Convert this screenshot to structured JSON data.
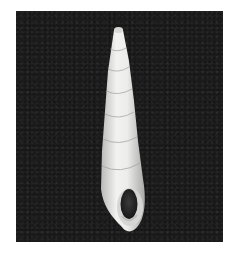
{
  "image": {
    "subject": "elongated turreted gastropod shell",
    "background": "dark textured backdrop",
    "colors": {
      "background": "#1c1c1c",
      "shell": "#e8e8e6",
      "shell_shadow": "#a9a9a7",
      "aperture": "#2a2a2a",
      "margin": "#ffffff"
    }
  }
}
